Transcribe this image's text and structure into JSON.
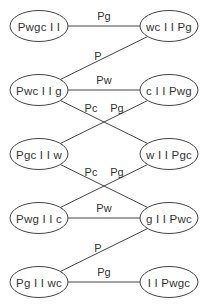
{
  "diagram": {
    "type": "state-transition-graph",
    "nodes": [
      {
        "id": "n1",
        "label": "Pwgc I I",
        "x": 39,
        "y": 26
      },
      {
        "id": "n2",
        "label": "wc I I Pg",
        "x": 169,
        "y": 26
      },
      {
        "id": "n3",
        "label": "Pwc I I g",
        "x": 39,
        "y": 90
      },
      {
        "id": "n4",
        "label": "c I I Pwg",
        "x": 169,
        "y": 90
      },
      {
        "id": "n5",
        "label": "Pgc I I w",
        "x": 39,
        "y": 154
      },
      {
        "id": "n6",
        "label": "w I I Pgc",
        "x": 169,
        "y": 154
      },
      {
        "id": "n7",
        "label": "Pwg I I c",
        "x": 39,
        "y": 218
      },
      {
        "id": "n8",
        "label": "g I I Pwc",
        "x": 169,
        "y": 218
      },
      {
        "id": "n9",
        "label": "Pg I I wc",
        "x": 39,
        "y": 282
      },
      {
        "id": "n10",
        "label": "I I Pwgc",
        "x": 169,
        "y": 282
      }
    ],
    "edges": [
      {
        "from": "n1",
        "to": "n2",
        "label": "Pg",
        "lx": 104,
        "ly": 20
      },
      {
        "from": "n3",
        "to": "n2",
        "label": "P",
        "lx": 98,
        "ly": 60
      },
      {
        "from": "n3",
        "to": "n4",
        "label": "Pw",
        "lx": 104,
        "ly": 84
      },
      {
        "from": "n3",
        "to": "n6",
        "label": "Pc",
        "lx": 91,
        "ly": 112
      },
      {
        "from": "n5",
        "to": "n4",
        "label": "Pg",
        "lx": 117,
        "ly": 112
      },
      {
        "from": "n5",
        "to": "n8",
        "label": "Pc",
        "lx": 91,
        "ly": 176
      },
      {
        "from": "n7",
        "to": "n6",
        "label": "Pg",
        "lx": 117,
        "ly": 176
      },
      {
        "from": "n7",
        "to": "n8",
        "label": "Pw",
        "lx": 104,
        "ly": 212
      },
      {
        "from": "n9",
        "to": "n8",
        "label": "P",
        "lx": 98,
        "ly": 252
      },
      {
        "from": "n9",
        "to": "n10",
        "label": "Pg",
        "lx": 104,
        "ly": 276
      }
    ]
  },
  "colors": {
    "stroke": "#444444",
    "text": "#333333",
    "background": "#ffffff"
  }
}
